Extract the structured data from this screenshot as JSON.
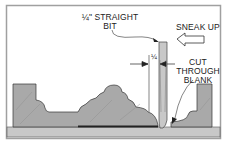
{
  "diagram": {
    "type": "woodworking-technical-illustration",
    "labels": {
      "bit_line1": "¼\" STRAIGHT",
      "bit_line2": "BIT",
      "sneak_up": "SNEAK UP",
      "quarter": "¼",
      "cut_line1": "CUT",
      "cut_line2": "THROUGH",
      "cut_line3": "BLANK"
    },
    "components": [
      "frame-border",
      "base-board",
      "molding-blank-left",
      "molding-blank-profile",
      "molding-blank-right",
      "straight-bit",
      "sneak-up-arrow",
      "dimension-arrows",
      "leader-lines"
    ],
    "colors": {
      "frame": "#9a9a9a",
      "wood": "#a9a9a9",
      "base": "#c4c4c4",
      "bit": "#c8c8c8",
      "outline": "#3a3a3a"
    }
  }
}
